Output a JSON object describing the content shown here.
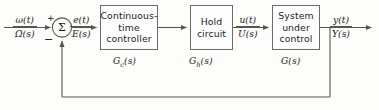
{
  "diagram": {
    "type": "control-system-block-diagram",
    "summing_junction": {
      "symbol": "Σ",
      "plus_sign": "+",
      "minus_sign": "−"
    },
    "blocks": [
      {
        "name": "continuous-time-controller",
        "lines": [
          "Continuous-",
          "time",
          "controller"
        ],
        "transfer_function_label": "G",
        "transfer_function_subscript": "c",
        "transfer_function_suffix": "(s)"
      },
      {
        "name": "hold-circuit",
        "lines": [
          "Hold",
          "circuit"
        ],
        "transfer_function_label": "G",
        "transfer_function_subscript": "h",
        "transfer_function_suffix": "(s)"
      },
      {
        "name": "system-under-control",
        "lines": [
          "System",
          "under",
          "control"
        ],
        "transfer_function_label": "G",
        "transfer_function_subscript": "",
        "transfer_function_suffix": "(s)"
      }
    ],
    "signals": [
      {
        "name": "reference-input",
        "time_domain": "ω(t)",
        "laplace_domain": "Ω(s)"
      },
      {
        "name": "error-signal",
        "time_domain": "e(t)",
        "laplace_domain": "E(s)"
      },
      {
        "name": "control-signal",
        "time_domain": "u(t)",
        "laplace_domain": "U(s)"
      },
      {
        "name": "output-signal",
        "time_domain": "y(t)",
        "laplace_domain": "Y(s)"
      }
    ],
    "colors": {
      "line": "#56564f",
      "block_border": "#6a6a68",
      "text": "#1b1b1b",
      "background": "#fdfdfc"
    }
  }
}
